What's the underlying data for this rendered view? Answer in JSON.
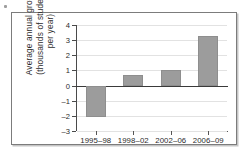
{
  "figure": {
    "speck_icon": "scan-speck",
    "frame_color": "#7c7c7c",
    "bar_color": "#9c9c9c",
    "zero_line_color": "#3a3a3a",
    "grid_color": "#e2e2e2"
  },
  "chart_data": {
    "type": "bar",
    "title": "",
    "xlabel": "",
    "ylabel": "Average annual growth (thousands of students per year)",
    "ylabel_lines": [
      "Average annual growth",
      "(thousands of students",
      "per year)"
    ],
    "categories": [
      "1995–98",
      "1998–02",
      "2002–06",
      "2006–09"
    ],
    "values": [
      -2.1,
      0.7,
      1.05,
      3.25
    ],
    "ylim": [
      -3,
      4
    ],
    "yticks": [
      4,
      3,
      2,
      1,
      0,
      -1,
      -2,
      -3
    ],
    "ytick_labels": [
      "4",
      "3",
      "2",
      "1",
      "0",
      "–1",
      "–2",
      "–3"
    ],
    "grid": true,
    "grid_axis": "y",
    "legend": null,
    "legend_position": "none",
    "zero_line": 0,
    "series": [
      {
        "name": "Average annual growth",
        "values": [
          -2.1,
          0.7,
          1.05,
          3.25
        ]
      }
    ]
  }
}
